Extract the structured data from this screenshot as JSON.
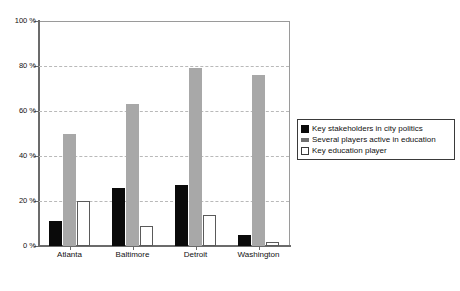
{
  "chart_data": {
    "type": "bar",
    "title": "",
    "subtitle": "",
    "xlabel": "",
    "ylabel": "",
    "categories": [
      "Atlanta",
      "Baltimore",
      "Detroit",
      "Washington"
    ],
    "series": [
      {
        "name": "Key stakeholders in city politics",
        "color": "#0a0a0a",
        "values": [
          11,
          26,
          27,
          5
        ]
      },
      {
        "name": "Several players active in education",
        "color": "#a8a8a8",
        "values": [
          50,
          63,
          79,
          76
        ]
      },
      {
        "name": "Key education player",
        "color": "#ffffff",
        "values": [
          20,
          9,
          14,
          2
        ]
      }
    ],
    "ylim": [
      0,
      100
    ],
    "ytick_values": [
      0,
      20,
      40,
      60,
      80,
      100
    ],
    "ytick_labels": [
      "0 %",
      "20 %",
      "40 %",
      "60 %",
      "80 %",
      "100 %"
    ],
    "grid": true,
    "grid_axis": "y",
    "grid_style": "dashed",
    "legend_position": "right",
    "legend_entries": [
      "Key stakeholders in city politics",
      "Several players active in education",
      "Key education player"
    ],
    "background_color": "#ffffff",
    "axis_color": "#6b6b6b",
    "grid_color": "#b9b9b9"
  }
}
